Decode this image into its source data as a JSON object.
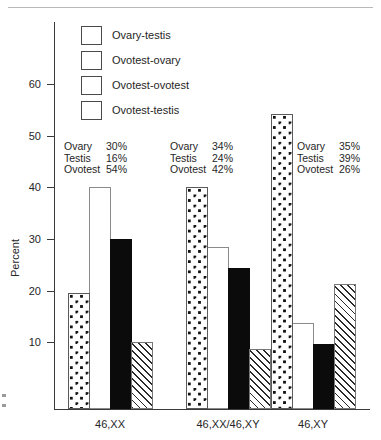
{
  "chart_data": {
    "type": "bar",
    "title": "",
    "subtitle": "",
    "xlabel": "",
    "ylabel": "Percent",
    "ylim": [
      0,
      66
    ],
    "grid": false,
    "legend_position": "top-left-inside",
    "y_ticks": [
      10,
      20,
      30,
      40,
      50,
      60
    ],
    "y_tick_labels": [
      "10",
      "20",
      "30",
      "40",
      "50",
      "60"
    ],
    "categories": [
      "46,XX",
      "46,XX/46,XY",
      "46,XY"
    ],
    "series": [
      {
        "name": "Ovary-testis",
        "pattern": "dotted",
        "values": [
          19.5,
          40.0,
          54.2
        ]
      },
      {
        "name": "Ovotest-ovary",
        "pattern": "white",
        "values": [
          40.0,
          28.5,
          13.8
        ]
      },
      {
        "name": "Ovotest-ovotest",
        "pattern": "black",
        "values": [
          30.0,
          24.3,
          9.7
        ]
      },
      {
        "name": "Ovotest-testis",
        "pattern": "hatched",
        "values": [
          10.0,
          8.7,
          21.2
        ]
      }
    ],
    "annotations": [
      {
        "group": "46,XX",
        "rows": [
          {
            "key": "Ovary",
            "value": "30%"
          },
          {
            "key": "Testis",
            "value": "16%"
          },
          {
            "key": "Ovotest",
            "value": "54%"
          }
        ]
      },
      {
        "group": "46,XX/46,XY",
        "rows": [
          {
            "key": "Ovary",
            "value": "34%"
          },
          {
            "key": "Testis",
            "value": "24%"
          },
          {
            "key": "Ovotest",
            "value": "42%"
          }
        ]
      },
      {
        "group": "46,XY",
        "rows": [
          {
            "key": "Ovary",
            "value": "35%"
          },
          {
            "key": "Testis",
            "value": "39%"
          },
          {
            "key": "Ovotest",
            "value": "26%"
          }
        ]
      }
    ],
    "colors": {
      "axis": "#3a3a3a",
      "text": "#262626",
      "bar_black": "#0b0b0b",
      "bar_outline": "#4a4a4a",
      "background": "#ffffff"
    }
  }
}
